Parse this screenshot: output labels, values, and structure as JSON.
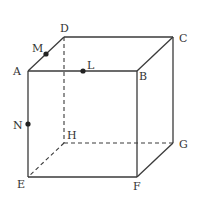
{
  "diagram": {
    "type": "cube",
    "vertices": {
      "A": {
        "label": "A",
        "x": 28,
        "y": 71,
        "lx": 13,
        "ly": 75
      },
      "B": {
        "label": "B",
        "x": 137,
        "y": 71,
        "lx": 139,
        "ly": 80
      },
      "C": {
        "label": "C",
        "x": 173,
        "y": 37,
        "lx": 179,
        "ly": 42
      },
      "D": {
        "label": "D",
        "x": 64,
        "y": 37,
        "lx": 60,
        "ly": 32
      },
      "E": {
        "label": "E",
        "x": 28,
        "y": 177,
        "lx": 17,
        "ly": 188
      },
      "F": {
        "label": "F",
        "x": 137,
        "y": 177,
        "lx": 133,
        "ly": 190
      },
      "G": {
        "label": "G",
        "x": 173,
        "y": 143,
        "lx": 179,
        "ly": 148
      },
      "H": {
        "label": "H",
        "x": 64,
        "y": 143,
        "lx": 67,
        "ly": 139
      }
    },
    "points": {
      "M": {
        "label": "M",
        "x": 46,
        "y": 54,
        "lx": 32,
        "ly": 52
      },
      "L": {
        "label": "L",
        "x": 83,
        "y": 71,
        "lx": 87,
        "ly": 69
      },
      "N": {
        "label": "N",
        "x": 28,
        "y": 124,
        "lx": 13,
        "ly": 129
      }
    },
    "visible_edges": [
      "AB",
      "BC",
      "CD",
      "DA",
      "AE",
      "EF",
      "BF",
      "FG",
      "CG"
    ],
    "hidden_edges": [
      "DH",
      "HE",
      "HG"
    ]
  }
}
